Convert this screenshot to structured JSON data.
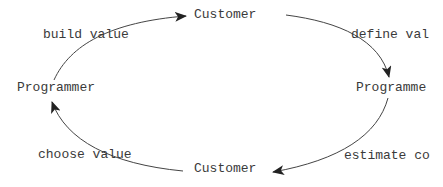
{
  "diagram": {
    "nodes": {
      "customer_top": "Customer",
      "programmer_right": "Programme",
      "customer_bottom": "Customer",
      "programmer_left": "Programmer"
    },
    "edges": {
      "build_value": "build value",
      "define_value": "define val",
      "estimate_cost": "estimate co",
      "choose_value": "choose value"
    },
    "colors": {
      "line": "#444444",
      "text": "#3a3a3a",
      "background": "#ffffff"
    }
  }
}
